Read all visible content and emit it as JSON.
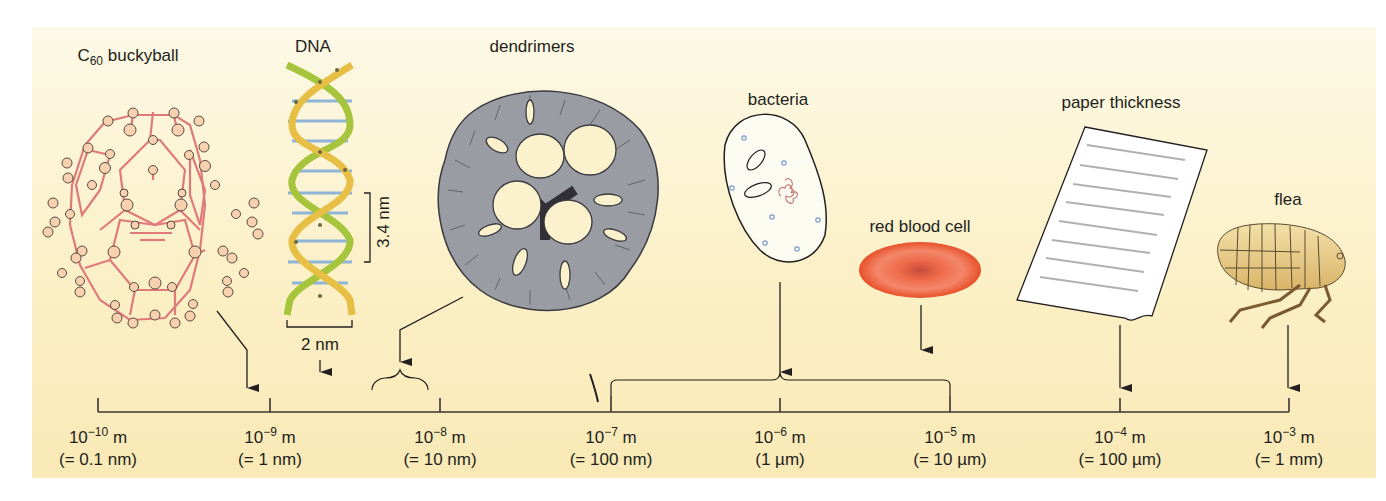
{
  "figure": {
    "background": "#fbefc4",
    "axis": {
      "unit": "m",
      "ticks": [
        {
          "exp": "−10",
          "base": "10",
          "unit": "m",
          "equiv": "(= 0.1 nm)",
          "x": 98
        },
        {
          "exp": "−9",
          "base": "10",
          "unit": "m",
          "equiv": "(= 1 nm)",
          "x": 270
        },
        {
          "exp": "−8",
          "base": "10",
          "unit": "m",
          "equiv": "(= 10 nm)",
          "x": 440
        },
        {
          "exp": "−7",
          "base": "10",
          "unit": "m",
          "equiv": "(= 100 nm)",
          "x": 611
        },
        {
          "exp": "−6",
          "base": "10",
          "unit": "m",
          "equiv": "(1 µm)",
          "x": 780
        },
        {
          "exp": "−5",
          "base": "10",
          "unit": "m",
          "equiv": "(= 10 µm)",
          "x": 950
        },
        {
          "exp": "−4",
          "base": "10",
          "unit": "m",
          "equiv": "(= 100 µm)",
          "x": 1120
        },
        {
          "exp": "−3",
          "base": "10",
          "unit": "m",
          "equiv": "(= 1 mm)",
          "x": 1289
        }
      ]
    },
    "objects": [
      {
        "id": "buckyball",
        "label_main": "C",
        "label_sub": "60",
        "label_rest": " buckyball",
        "color": "#e88a8a"
      },
      {
        "id": "dna",
        "label": "DNA",
        "pitch_label": "3.4 nm",
        "width_label": "2 nm",
        "colors": {
          "strand_a": "#a6c43c",
          "strand_b": "#e6bf44",
          "base_pairs": "#8eb4d8"
        }
      },
      {
        "id": "dendrimers",
        "label": "dendrimers",
        "color": "#8a8c94"
      },
      {
        "id": "bacteria",
        "label": "bacteria"
      },
      {
        "id": "red-blood-cell",
        "label": "red blood cell",
        "color": "#e8502a"
      },
      {
        "id": "paper",
        "label": "paper thickness"
      },
      {
        "id": "flea",
        "label": "flea",
        "color": "#e2c27a"
      }
    ]
  }
}
